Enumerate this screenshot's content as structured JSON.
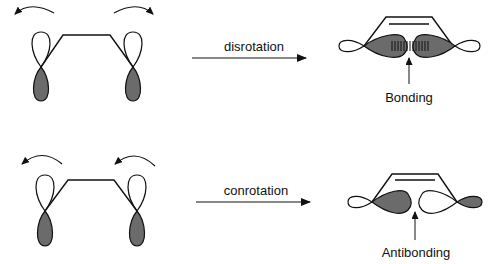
{
  "top_row": {
    "process_label": "disrotation",
    "result_label": "Bonding",
    "rotation": "disrotatory (left counter-clockwise, right clockwise)"
  },
  "bottom_row": {
    "process_label": "conrotation",
    "result_label": "Antibonding",
    "rotation": "conrotatory (both counter-clockwise)"
  },
  "colors": {
    "shaded_lobe": "#6b6b6b",
    "line": "#111111",
    "background": "#ffffff"
  }
}
